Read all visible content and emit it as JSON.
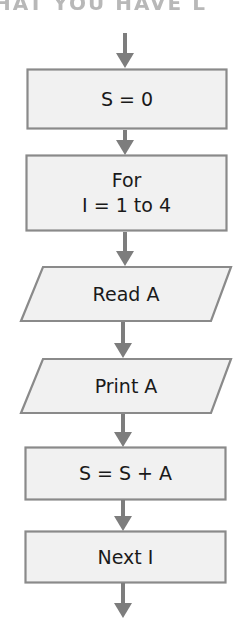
{
  "heading": {
    "text": "HAT YOU HAVE L"
  },
  "colors": {
    "box_fill": "#f1f1f1",
    "box_stroke": "#8a8a8a",
    "arrow": "#7d7d7d",
    "text": "#1a1a1a"
  },
  "flowchart": {
    "nodes": [
      {
        "id": "init",
        "shape": "process",
        "label": "S = 0"
      },
      {
        "id": "loop",
        "shape": "process",
        "label": "For\nI = 1 to 4"
      },
      {
        "id": "read",
        "shape": "input-output",
        "label": "Read A"
      },
      {
        "id": "print",
        "shape": "input-output",
        "label": "Print A"
      },
      {
        "id": "accum",
        "shape": "process",
        "label": "S = S + A"
      },
      {
        "id": "next",
        "shape": "process",
        "label": "Next I"
      }
    ],
    "edges": [
      {
        "from": "start",
        "to": "init"
      },
      {
        "from": "init",
        "to": "loop"
      },
      {
        "from": "loop",
        "to": "read"
      },
      {
        "from": "read",
        "to": "print"
      },
      {
        "from": "print",
        "to": "accum"
      },
      {
        "from": "accum",
        "to": "next"
      },
      {
        "from": "next",
        "to": "end"
      }
    ]
  }
}
